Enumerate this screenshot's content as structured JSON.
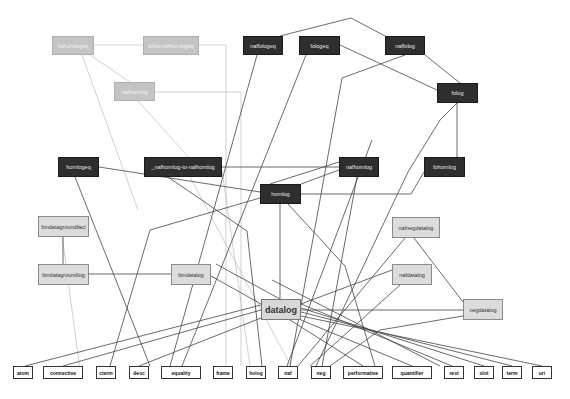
{
  "diagram": {
    "title": "",
    "colors": {
      "dark": "#2e2e2e",
      "gray": "#c4c4c4",
      "light": "#dcdcdc",
      "leaf": "#ffffff",
      "edge": "#444444",
      "edge_light": "#bbbbbb"
    },
    "nodes": [
      {
        "id": "hohornlogeq",
        "label": "hohornlogeq",
        "x": 52,
        "y": 36,
        "w": 42,
        "h": 19,
        "style": "gray"
      },
      {
        "id": "fohornlogeqlogeq",
        "label": "fohornlofhornlogeq",
        "x": 143,
        "y": 36,
        "w": 56,
        "h": 19,
        "style": "gray"
      },
      {
        "id": "nafhornlog",
        "label": "nafhornlog",
        "x": 114,
        "y": 82,
        "w": 41,
        "h": 19,
        "style": "gray"
      },
      {
        "id": "naffologeq",
        "label": "naffologeq",
        "x": 243,
        "y": 36,
        "w": 40,
        "h": 19,
        "style": "dark"
      },
      {
        "id": "fologeq",
        "label": "fologeq",
        "x": 299,
        "y": 36,
        "w": 41,
        "h": 19,
        "style": "dark"
      },
      {
        "id": "naffolog",
        "label": "naffolog",
        "x": 385,
        "y": 36,
        "w": 40,
        "h": 19,
        "style": "dark"
      },
      {
        "id": "folog",
        "label": "folog",
        "x": 437,
        "y": 83,
        "w": 41,
        "h": 20,
        "style": "dark"
      },
      {
        "id": "hornlogeq",
        "label": "hornlogeq",
        "x": 58,
        "y": 157,
        "w": 41,
        "h": 20,
        "style": "dark"
      },
      {
        "id": "nafhornlog-to-nafhornlog",
        "label": "_nafhornlog-to-nafhornlog",
        "x": 144,
        "y": 157,
        "w": 78,
        "h": 20,
        "style": "dark"
      },
      {
        "id": "nafhornlog2",
        "label": "nafhornlog",
        "x": 339,
        "y": 157,
        "w": 40,
        "h": 20,
        "style": "dark"
      },
      {
        "id": "fohornlog",
        "label": "fohornlog",
        "x": 424,
        "y": 157,
        "w": 41,
        "h": 20,
        "style": "dark"
      },
      {
        "id": "hornlog",
        "label": "hornlog",
        "x": 260,
        "y": 184,
        "w": 41,
        "h": 20,
        "style": "dark"
      },
      {
        "id": "bindatagroundfact",
        "label": "bindatagroundfact",
        "x": 38,
        "y": 216,
        "w": 51,
        "h": 21,
        "style": "light"
      },
      {
        "id": "bindatagroundlog",
        "label": "bindatagroundlog",
        "x": 38,
        "y": 264,
        "w": 51,
        "h": 21,
        "style": "light"
      },
      {
        "id": "bindatalog",
        "label": "bindatalog",
        "x": 171,
        "y": 264,
        "w": 40,
        "h": 21,
        "style": "light"
      },
      {
        "id": "nafnegdatalog",
        "label": "nafnegdatalog",
        "x": 392,
        "y": 217,
        "w": 48,
        "h": 21,
        "style": "light"
      },
      {
        "id": "nafdatalog",
        "label": "nafdatalog",
        "x": 392,
        "y": 264,
        "w": 40,
        "h": 21,
        "style": "light"
      },
      {
        "id": "datalog",
        "label": "datalog",
        "x": 261,
        "y": 299,
        "w": 40,
        "h": 21,
        "style": "center"
      },
      {
        "id": "negdatalog",
        "label": "negdatalog",
        "x": 463,
        "y": 299,
        "w": 40,
        "h": 21,
        "style": "light"
      },
      {
        "id": "atom",
        "label": "atom",
        "x": 13,
        "y": 366,
        "w": 20,
        "h": 13,
        "style": "leaf"
      },
      {
        "id": "connective",
        "label": "connective",
        "x": 43,
        "y": 366,
        "w": 40,
        "h": 13,
        "style": "leaf"
      },
      {
        "id": "cterm",
        "label": "cterm",
        "x": 96,
        "y": 366,
        "w": 20,
        "h": 13,
        "style": "leaf"
      },
      {
        "id": "desc",
        "label": "desc",
        "x": 129,
        "y": 366,
        "w": 20,
        "h": 13,
        "style": "leaf"
      },
      {
        "id": "equality",
        "label": "equality",
        "x": 161,
        "y": 366,
        "w": 40,
        "h": 13,
        "style": "leaf"
      },
      {
        "id": "frame",
        "label": "frame",
        "x": 213,
        "y": 366,
        "w": 20,
        "h": 13,
        "style": "leaf"
      },
      {
        "id": "holog",
        "label": "holog",
        "x": 246,
        "y": 366,
        "w": 20,
        "h": 13,
        "style": "leaf"
      },
      {
        "id": "naf",
        "label": "naf",
        "x": 278,
        "y": 366,
        "w": 20,
        "h": 13,
        "style": "leaf"
      },
      {
        "id": "neg",
        "label": "neg",
        "x": 311,
        "y": 366,
        "w": 20,
        "h": 13,
        "style": "leaf"
      },
      {
        "id": "performative",
        "label": "performative",
        "x": 343,
        "y": 366,
        "w": 40,
        "h": 13,
        "style": "leaf"
      },
      {
        "id": "quantifier",
        "label": "quantifier",
        "x": 392,
        "y": 366,
        "w": 40,
        "h": 13,
        "style": "leaf"
      },
      {
        "id": "rest",
        "label": "rest",
        "x": 444,
        "y": 366,
        "w": 20,
        "h": 13,
        "style": "leaf"
      },
      {
        "id": "slot",
        "label": "slot",
        "x": 474,
        "y": 366,
        "w": 20,
        "h": 13,
        "style": "leaf"
      },
      {
        "id": "term",
        "label": "term",
        "x": 502,
        "y": 366,
        "w": 20,
        "h": 13,
        "style": "leaf"
      },
      {
        "id": "uri",
        "label": "uri",
        "x": 532,
        "y": 366,
        "w": 20,
        "h": 13,
        "style": "leaf"
      }
    ],
    "edges": [
      {
        "d": "M94,45 L143,45",
        "light": true
      },
      {
        "d": "M82,55 L138,210",
        "light": true
      },
      {
        "d": "M90,55 L130,82",
        "light": true
      },
      {
        "d": "M199,45 L226,45 L226,366",
        "light": true
      },
      {
        "d": "M155,92 L241,92 L241,366",
        "light": true
      },
      {
        "d": "M138,101 L200,170",
        "light": true
      },
      {
        "d": "M222,170 L250,366",
        "light": true
      },
      {
        "d": "M190,177 L291,366",
        "light": true
      },
      {
        "d": "M60,220 L80,370",
        "light": true
      },
      {
        "d": "M280,36 L351,18 L385,36"
      },
      {
        "d": "M257,55 L170,366"
      },
      {
        "d": "M306,55 L182,366"
      },
      {
        "d": "M340,45 L437,90"
      },
      {
        "d": "M405,55 L342,78 L290,366"
      },
      {
        "d": "M425,55 L460,83"
      },
      {
        "d": "M457,103 L457,157"
      },
      {
        "d": "M457,103 L440,120 L408,172 L316,366"
      },
      {
        "d": "M99,167 L260,192"
      },
      {
        "d": "M222,167 L339,167"
      },
      {
        "d": "M75,177 L150,366"
      },
      {
        "d": "M168,177 L247,231 L262,366"
      },
      {
        "d": "M339,170 L301,184"
      },
      {
        "d": "M339,162 L270,184"
      },
      {
        "d": "M357,177 L322,366"
      },
      {
        "d": "M372,140 L287,366"
      },
      {
        "d": "M424,172 L411,194 L301,194"
      },
      {
        "d": "M280,204 L280,299"
      },
      {
        "d": "M260,198 L150,230 L110,366"
      },
      {
        "d": "M288,204 L345,266 L375,366"
      },
      {
        "d": "M63,237 L63,264"
      },
      {
        "d": "M89,274 L171,274"
      },
      {
        "d": "M211,276 L261,304"
      },
      {
        "d": "M216,264 L280,299"
      },
      {
        "d": "M405,238 L298,366"
      },
      {
        "d": "M414,238 L463,302"
      },
      {
        "d": "M392,270 L301,304"
      },
      {
        "d": "M400,285 L310,366"
      },
      {
        "d": "M301,310 L463,310"
      },
      {
        "d": "M463,316 L380,330 L330,366"
      },
      {
        "d": "M261,305 L25,366"
      },
      {
        "d": "M261,310 L63,366"
      },
      {
        "d": "M261,318 L139,366"
      },
      {
        "d": "M301,304 L452,366"
      },
      {
        "d": "M301,308 L484,366"
      },
      {
        "d": "M301,312 L512,366"
      },
      {
        "d": "M301,316 L542,366"
      },
      {
        "d": "M301,320 L412,366"
      },
      {
        "d": "M290,320 L363,366"
      },
      {
        "d": "M272,280 L440,366"
      }
    ]
  }
}
